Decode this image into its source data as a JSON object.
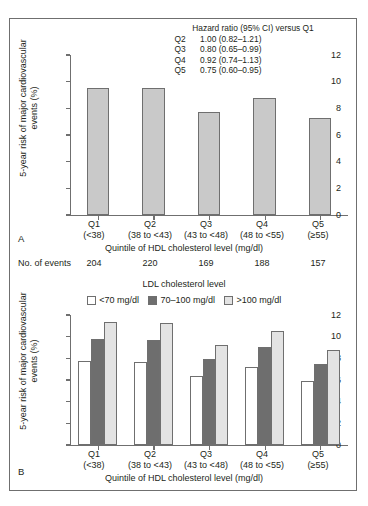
{
  "figure": {
    "panel_a": {
      "letter": "A",
      "ylabel": [
        "5-year risk of major cardiovascular",
        "events (%)"
      ],
      "xtitle": "Quintile of HDL cholesterol level (mg/dl)",
      "hazard": {
        "title": "Hazard ratio (95% CI) versus Q1",
        "rows": [
          {
            "q": "Q2",
            "value": "1.00 (0.82–1.21)"
          },
          {
            "q": "Q3",
            "value": "0.80 (0.65–0.99)"
          },
          {
            "q": "Q4",
            "value": "0.92 (0.74–1.13)"
          },
          {
            "q": "Q5",
            "value": "0.75 (0.60–0.95)"
          }
        ]
      },
      "events_label": "No. of events",
      "events": [
        "204",
        "220",
        "169",
        "188",
        "157"
      ]
    },
    "panel_b": {
      "letter": "B",
      "ylabel": [
        "5-year risk of major cardiovascular",
        "events (%)"
      ],
      "xtitle": "Quintile of HDL cholesterol level (mg/dl)",
      "legend_title": "LDL cholesterol level",
      "legend": [
        {
          "label": "<70 mg/dl",
          "color": "#ffffff"
        },
        {
          "label": "70–100 mg/dl",
          "color": "#6e6e6e"
        },
        {
          "label": ">100 mg/dl",
          "color": "#e3e3e3"
        }
      ]
    }
  },
  "chart_data": [
    {
      "type": "bar",
      "panel": "A",
      "title": "",
      "xlabel": "Quintile of HDL cholesterol level (mg/dl)",
      "ylabel": "5-year risk of major cardiovascular events (%)",
      "ylim": [
        0,
        12
      ],
      "yticks": [
        0,
        2,
        4,
        6,
        8,
        10,
        12
      ],
      "grid": false,
      "categories": [
        "Q1",
        "Q2",
        "Q3",
        "Q4",
        "Q5"
      ],
      "category_ranges": [
        "(<38)",
        "(38 to <43)",
        "(43 to <48)",
        "(48 to <55)",
        "(≥55)"
      ],
      "values": [
        9.55,
        9.5,
        7.75,
        8.75,
        7.3
      ],
      "bar_color": "#c9c9c9",
      "annotations": {
        "hazard_ratio_title": "Hazard ratio (95% CI) versus Q1",
        "hazard_ratios": [
          {
            "group": "Q2",
            "hr": 1.0,
            "ci": [
              0.82,
              1.21
            ],
            "text": "1.00 (0.82–1.21)"
          },
          {
            "group": "Q3",
            "hr": 0.8,
            "ci": [
              0.65,
              0.99
            ],
            "text": "0.80 (0.65–0.99)"
          },
          {
            "group": "Q4",
            "hr": 0.92,
            "ci": [
              0.74,
              1.13
            ],
            "text": "0.92 (0.74–1.13)"
          },
          {
            "group": "Q5",
            "hr": 0.75,
            "ci": [
              0.6,
              0.95
            ],
            "text": "0.75 (0.60–0.95)"
          }
        ],
        "no_of_events": [
          204,
          220,
          169,
          188,
          157
        ]
      }
    },
    {
      "type": "bar",
      "panel": "B",
      "title": "LDL cholesterol level",
      "xlabel": "Quintile of HDL cholesterol level (mg/dl)",
      "ylabel": "5-year risk of major cardiovascular events (%)",
      "ylim": [
        0,
        12
      ],
      "yticks": [
        0,
        2,
        4,
        6,
        8,
        10,
        12
      ],
      "grid": false,
      "legend_position": "top-center",
      "categories": [
        "Q1",
        "Q2",
        "Q3",
        "Q4",
        "Q5"
      ],
      "category_ranges": [
        "(<38)",
        "(38 to <43)",
        "(43 to <48)",
        "(48 to <55)",
        "(≥55)"
      ],
      "series": [
        {
          "name": "<70 mg/dl",
          "color": "#ffffff",
          "values": [
            7.8,
            7.7,
            6.35,
            7.2,
            5.9
          ]
        },
        {
          "name": "70–100 mg/dl",
          "color": "#6e6e6e",
          "values": [
            9.75,
            9.7,
            7.95,
            9.05,
            7.5
          ]
        },
        {
          "name": ">100 mg/dl",
          "color": "#e3e3e3",
          "values": [
            11.4,
            11.3,
            9.2,
            10.55,
            8.75
          ]
        }
      ]
    }
  ]
}
